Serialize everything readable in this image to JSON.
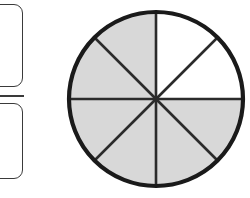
{
  "widget": {
    "title": "Fraction shaded-parts model",
    "answer_input": {
      "numerator_placeholder": "",
      "numerator_value": "",
      "denominator_placeholder": "",
      "denominator_value": "",
      "fraction_bar_label": "fraction-bar"
    }
  },
  "colors": {
    "shaded_fill": "#d8d8d8",
    "unshaded_fill": "#ffffff",
    "outline": "#1a1a1a",
    "divider": "#2b2b2b",
    "box_border": "#3a3a3a",
    "background": "#ffffff"
  },
  "chart_data": {
    "type": "pie",
    "title": "",
    "xlabel": "",
    "ylabel": "",
    "total_parts": 8,
    "shaded_parts": 6,
    "unshaded_parts": 2,
    "fraction_shaded": "6/8",
    "sector_angle_degrees": 45,
    "center_x": 91,
    "center_y": 94,
    "radius": 87,
    "categories": [
      "sector-1",
      "sector-2",
      "sector-3",
      "sector-4",
      "sector-5",
      "sector-6",
      "sector-7",
      "sector-8"
    ],
    "values": [
      45,
      45,
      45,
      45,
      45,
      45,
      45,
      45
    ],
    "sectors": [
      {
        "name": "sector-1",
        "start_deg": 0,
        "end_deg": 45,
        "shaded": false,
        "fill": "#ffffff"
      },
      {
        "name": "sector-2",
        "start_deg": 45,
        "end_deg": 90,
        "shaded": false,
        "fill": "#ffffff"
      },
      {
        "name": "sector-3",
        "start_deg": 90,
        "end_deg": 135,
        "shaded": true,
        "fill": "#d8d8d8"
      },
      {
        "name": "sector-4",
        "start_deg": 135,
        "end_deg": 180,
        "shaded": true,
        "fill": "#d8d8d8"
      },
      {
        "name": "sector-5",
        "start_deg": 180,
        "end_deg": 225,
        "shaded": true,
        "fill": "#d8d8d8"
      },
      {
        "name": "sector-6",
        "start_deg": 225,
        "end_deg": 270,
        "shaded": true,
        "fill": "#d8d8d8"
      },
      {
        "name": "sector-7",
        "start_deg": 270,
        "end_deg": 315,
        "shaded": true,
        "fill": "#d8d8d8"
      },
      {
        "name": "sector-8",
        "start_deg": 315,
        "end_deg": 360,
        "shaded": true,
        "fill": "#d8d8d8"
      }
    ],
    "dividers": [
      {
        "name": "divider-vertical",
        "angle_deg": 0
      },
      {
        "name": "divider-diagonal-ne-sw",
        "angle_deg": 45
      },
      {
        "name": "divider-horizontal",
        "angle_deg": 90
      },
      {
        "name": "divider-diagonal-nw-se",
        "angle_deg": 135
      }
    ],
    "legend": [],
    "grid": false
  }
}
